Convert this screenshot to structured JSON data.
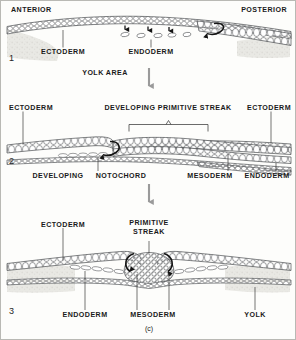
{
  "figure": {
    "caption": "(c)",
    "orientation": {
      "anterior": "ANTERIOR",
      "posterior": "POSTERIOR"
    },
    "panels": [
      {
        "number": "1",
        "labels": [
          {
            "text": "ECTODERM"
          },
          {
            "text": "ENDODERM"
          },
          {
            "text": "YOLK AREA"
          }
        ]
      },
      {
        "number": "2",
        "labels": [
          {
            "text": "ECTODERM"
          },
          {
            "text": "DEVELOPING PRIMITIVE STREAK"
          },
          {
            "text": "ECTODERM"
          },
          {
            "text": "DEVELOPING"
          },
          {
            "text": "NOTOCHORD"
          },
          {
            "text": "MESODERM"
          },
          {
            "text": "ENDODERM"
          }
        ]
      },
      {
        "number": "3",
        "labels": [
          {
            "text": "ECTODERM"
          },
          {
            "text": "PRIMITIVE"
          },
          {
            "text": "STREAK"
          },
          {
            "text": "ENDODERM"
          },
          {
            "text": "MESODERM"
          },
          {
            "text": "YOLK"
          }
        ]
      }
    ]
  },
  "colors": {
    "ink": "#1a1a1a",
    "cell_stroke": "#55575a",
    "yolk": "#c9c8c2",
    "arrow_gray": "#9a9a9a",
    "frame": "#b9b9b4",
    "background": "#fdfdfb"
  },
  "text": {
    "anterior": "ANTERIOR",
    "posterior": "POSTERIOR",
    "ectoderm": "ECTODERM",
    "endoderm": "ENDODERM",
    "mesoderm": "MESODERM",
    "yolk_area": "YOLK AREA",
    "yolk": "YOLK",
    "developing_primitive_streak": "DEVELOPING PRIMITIVE STREAK",
    "developing": "DEVELOPING",
    "notochord": "NOTOCHORD",
    "primitive": "PRIMITIVE",
    "streak": "STREAK",
    "panel1": "1",
    "panel2": "2",
    "panel3": "3",
    "caption": "(c)"
  }
}
